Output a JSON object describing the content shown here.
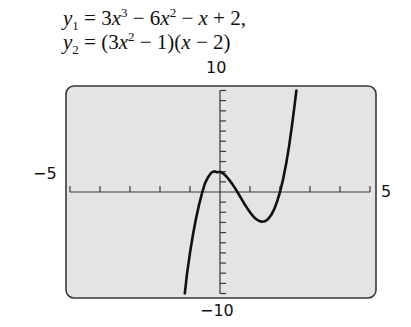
{
  "equations": {
    "y1": {
      "lhs": "y",
      "sub": "1",
      "parts": [
        "3",
        "x",
        "3",
        "6",
        "x",
        "2",
        "x",
        "2,"
      ]
    },
    "y2": {
      "lhs": "y",
      "sub": "2",
      "parts": [
        "(3",
        "x",
        "2",
        "1)(",
        "x",
        "2)"
      ]
    },
    "line1_text": "y1 = 3x^3 − 6x^2 − x + 2,",
    "line2_text": "y2 = (3x^2 − 1)(x − 2)"
  },
  "axis_labels": {
    "ymax": "10",
    "ymin": "−10",
    "xmin": "−5",
    "xmax": "5"
  },
  "colors": {
    "screen_bg": "#e4e4e4",
    "frame": "#3a3a3a",
    "curve": "#111111",
    "axes": "#3a3a3a"
  },
  "chart_data": {
    "type": "line",
    "xlabel": "",
    "ylabel": "",
    "xlim": [
      -5,
      5
    ],
    "ylim": [
      -10,
      10
    ],
    "xscl": 1,
    "yscl": 1,
    "grid": false,
    "legend": "none",
    "tick_labels": {
      "x": [
        "−5",
        "5"
      ],
      "y": [
        "−10",
        "10"
      ]
    },
    "series": [
      {
        "name": "y1 = y2",
        "x": [
          -1.175,
          -1.1,
          -1.0,
          -0.9,
          -0.8,
          -0.7,
          -0.6,
          -0.5,
          -0.4,
          -0.3,
          -0.2,
          -0.1,
          0.0,
          0.1,
          0.2,
          0.3,
          0.4,
          0.5,
          0.6,
          0.7,
          0.8,
          0.9,
          1.0,
          1.1,
          1.2,
          1.3,
          1.4,
          1.5,
          1.6,
          1.7,
          1.8,
          1.9,
          2.0,
          2.1,
          2.2,
          2.3,
          2.4,
          2.5,
          2.545
        ],
        "y": [
          -10.0,
          -8.07,
          -6.0,
          -4.19,
          -2.62,
          -1.27,
          -0.12,
          0.88,
          1.45,
          1.88,
          2.04,
          1.95,
          2.0,
          1.84,
          1.58,
          1.22,
          0.83,
          0.38,
          -0.1,
          -0.61,
          -1.1,
          -1.57,
          -2.0,
          -2.37,
          -2.66,
          -2.85,
          -2.93,
          -2.88,
          -2.67,
          -2.3,
          -1.74,
          -0.97,
          0.0,
          1.22,
          2.7,
          4.47,
          6.55,
          8.88,
          10.0
        ]
      }
    ]
  }
}
